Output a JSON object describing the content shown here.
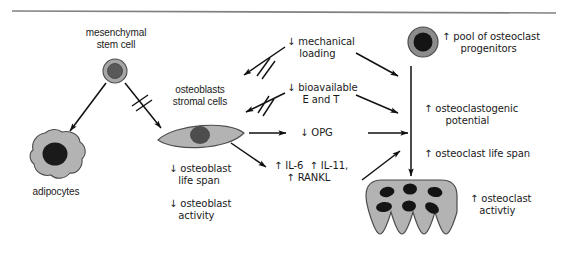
{
  "figure": {
    "type": "biological-pathway-diagram",
    "top_rule": true,
    "background_color": "#ffffff",
    "text_color": "#1a1a1a"
  },
  "palette": {
    "cell_fill": "#b3b3b3",
    "cell_stroke": "#4d4d4d",
    "nucleus_dark": "#1a1a1a",
    "nucleus_mid": "#595959",
    "stem_ring": "#a6a6a6",
    "arrow": "#111111",
    "rule": "#808080"
  },
  "cells": [
    {
      "id": "mesenchymal-stem-cell",
      "name": "mesenchymal stem cell",
      "label_lines": [
        "mesenchymal",
        "stem cell"
      ],
      "shape": "concentric-circle",
      "cx": 115,
      "cy": 71,
      "r_outer": 12,
      "r_inner": 7.5
    },
    {
      "id": "adipocyte",
      "name": "adipocytes",
      "label_lines": [
        "adipocytes"
      ],
      "shape": "irregular-blob",
      "cx": 55,
      "cy": 155
    },
    {
      "id": "osteoblast",
      "name": "osteoblasts stromal cells",
      "label_lines": [
        "osteoblasts",
        "stromal cells"
      ],
      "shape": "spindle",
      "cx": 200,
      "cy": 137
    },
    {
      "id": "osteoclast-progenitor",
      "name": "osteoclast progenitor",
      "shape": "concentric-circle",
      "cx": 423,
      "cy": 42,
      "r_outer": 15,
      "r_inner": 9.5
    },
    {
      "id": "osteoclast",
      "name": "osteoclast",
      "shape": "ruffled-multinucleated",
      "nuclei_count": 6,
      "ruffles_count": 6,
      "cx": 411,
      "cy": 205
    }
  ],
  "labels": {
    "mesenchymal_stem_cell": "mesenchymal\nstem cell",
    "adipocytes": "adipocytes",
    "osteoblasts_stromal_cells": "osteoblasts\nstromal cells",
    "osteoblast_life_span": "↓ osteoblast\n   life span",
    "osteoblast_activity": "↓ osteoblast\n   activity",
    "mechanical_loading": "↓ mechanical\n    loading",
    "bioavailable_e_and_t": "↓ bioavailable\n     E and T",
    "opg": "↓ OPG",
    "il6_il11_rankl": "↑ IL-6  ↑ IL-11,\n    ↑ RANKL",
    "pool_of_osteoclast_progenitors": "↑ pool of osteoclast\n      progenitors",
    "osteoclastogenic_potential": "↑ osteoclastogenic\n       potential",
    "osteoclast_life_span": "↑ osteoclast life span",
    "osteoclast_activity": "↑ osteoclast\n   activtiy"
  },
  "annotations": {
    "inhibited_arrows": 3,
    "inhibition_marker": "double-slash",
    "arrow_count": 12
  }
}
